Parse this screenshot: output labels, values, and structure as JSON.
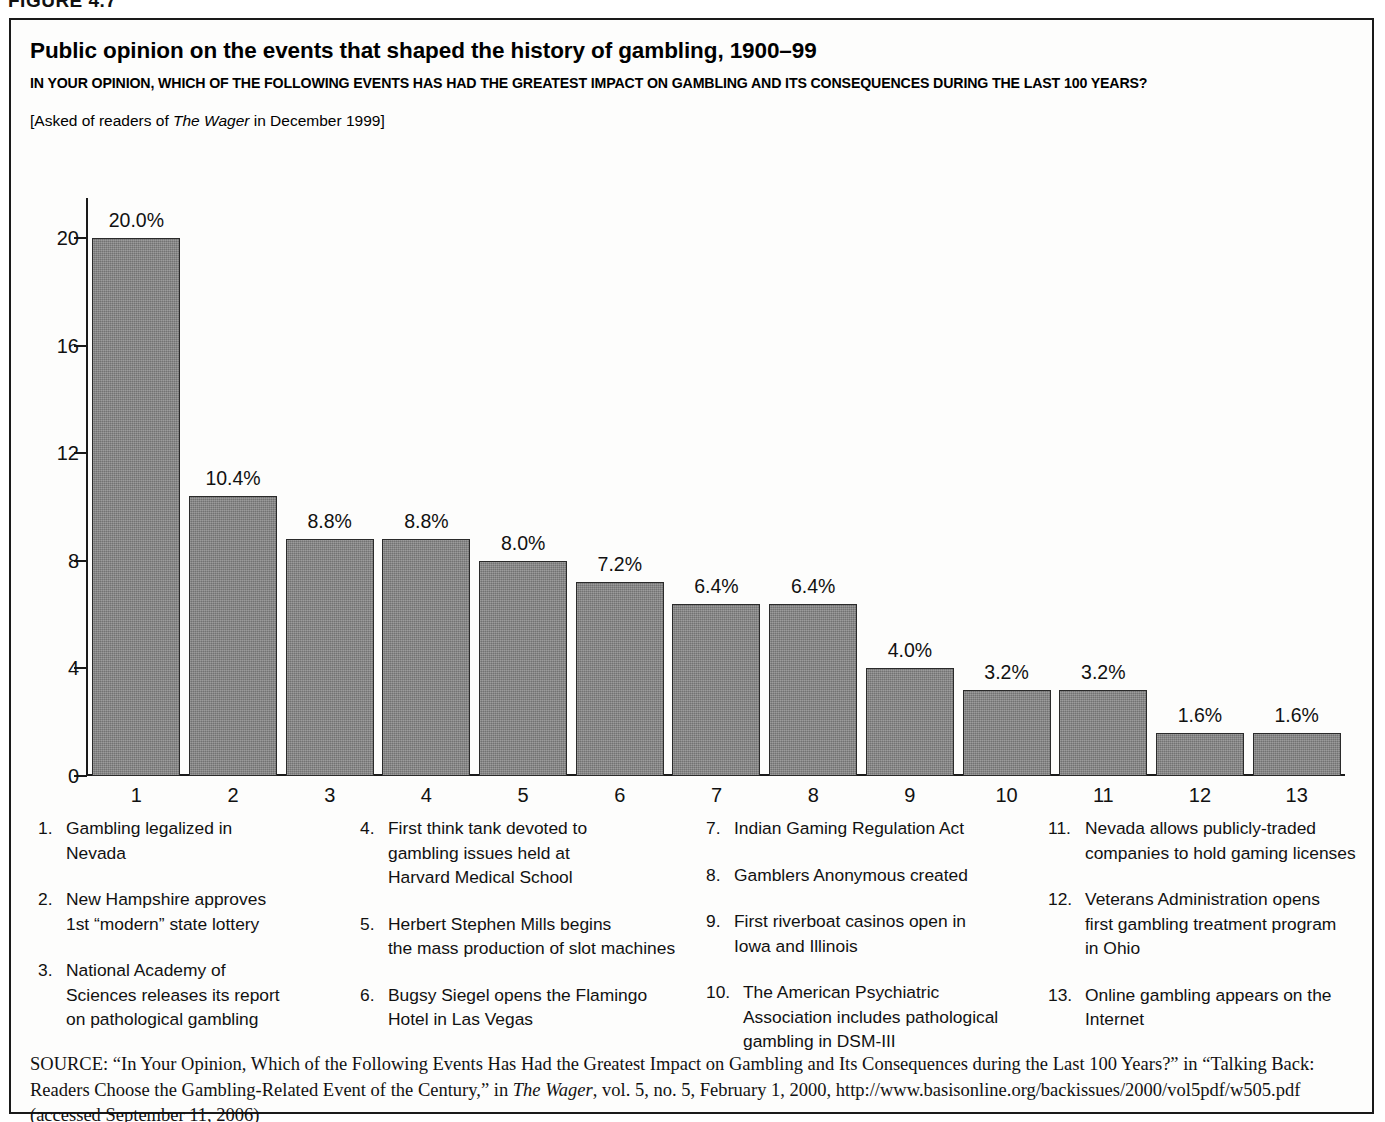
{
  "figure": {
    "label": "FIGURE 4.7"
  },
  "header": {
    "title": "Public opinion on the events that shaped the history of gambling, 1900–99",
    "subtitle": "IN YOUR OPINION, WHICH OF THE FOLLOWING EVENTS HAS HAD THE GREATEST IMPACT ON GAMBLING AND ITS CONSEQUENCES DURING THE LAST 100 YEARS?",
    "asked_prefix": "[Asked of readers of ",
    "asked_italic": "The Wager",
    "asked_suffix": " in December 1999]"
  },
  "chart_data": {
    "type": "bar",
    "title": "Public opinion on the events that shaped the history of gambling, 1900–99",
    "xlabel": "",
    "ylabel": "",
    "ylim": [
      0,
      21.5
    ],
    "yticks": [
      0,
      4,
      8,
      12,
      16,
      20
    ],
    "grid": false,
    "legend_position": "below-chart",
    "bar_color": "#808080",
    "bar_edge_color": "#2a2a2a",
    "categories": [
      "1",
      "2",
      "3",
      "4",
      "5",
      "6",
      "7",
      "8",
      "9",
      "10",
      "11",
      "12",
      "13"
    ],
    "values": [
      20.0,
      10.4,
      8.8,
      8.8,
      8.0,
      7.2,
      6.4,
      6.4,
      4.0,
      3.2,
      3.2,
      1.6,
      1.6
    ],
    "data_labels": [
      "20.0%",
      "10.4%",
      "8.8%",
      "8.8%",
      "8.0%",
      "7.2%",
      "6.4%",
      "6.4%",
      "4.0%",
      "3.2%",
      "3.2%",
      "1.6%",
      "1.6%"
    ],
    "annotations": [
      "1. Gambling legalized in Nevada",
      "2. New Hampshire approves 1st “modern” state lottery",
      "3. National Academy of Sciences releases its report on pathological gambling",
      "4. First think tank devoted to gambling issues held at Harvard Medical School",
      "5. Herbert Stephen Mills begins the mass production of slot machines",
      "6. Bugsy Siegel opens the Flamingo Hotel in Las Vegas",
      "7. Indian Gaming Regulation Act",
      "8. Gamblers Anonymous created",
      "9. First riverboat casinos open in Iowa and Illinois",
      "10. The American Psychiatric Association includes pathological gambling in DSM-III",
      "11. Nevada allows publicly-traded companies to hold gaming licenses",
      "12. Veterans Administration opens first gambling treatment program in Ohio",
      "13. Online gambling appears on the Internet"
    ]
  },
  "legend": {
    "columns": [
      {
        "items": [
          {
            "num": "1.",
            "lines": [
              "Gambling legalized in",
              "Nevada"
            ]
          },
          {
            "num": "2.",
            "lines": [
              "New Hampshire approves",
              "1st “modern” state lottery"
            ]
          },
          {
            "num": "3.",
            "lines": [
              "National Academy of",
              "Sciences releases its report",
              "on pathological gambling"
            ]
          }
        ]
      },
      {
        "items": [
          {
            "num": "4.",
            "lines": [
              "First think tank devoted to",
              "gambling issues held at",
              "Harvard Medical School"
            ]
          },
          {
            "num": "5.",
            "lines": [
              "Herbert Stephen Mills begins",
              "the mass production of slot machines"
            ]
          },
          {
            "num": "6.",
            "lines": [
              "Bugsy Siegel opens the Flamingo",
              "Hotel in Las Vegas"
            ]
          }
        ]
      },
      {
        "items": [
          {
            "num": "7.",
            "lines": [
              "Indian Gaming Regulation Act"
            ]
          },
          {
            "num": "8.",
            "lines": [
              "Gamblers Anonymous created"
            ]
          },
          {
            "num": "9.",
            "lines": [
              "First riverboat casinos open in",
              "Iowa and Illinois"
            ]
          },
          {
            "num": "10.",
            "lines": [
              "The American Psychiatric",
              "Association includes pathological",
              "gambling in DSM-III"
            ]
          }
        ]
      },
      {
        "items": [
          {
            "num": "11.",
            "lines": [
              "Nevada allows publicly-traded",
              "companies to hold gaming licenses"
            ]
          },
          {
            "num": "12.",
            "lines": [
              "Veterans Administration opens",
              "first gambling treatment program",
              "in Ohio"
            ]
          },
          {
            "num": "13.",
            "lines": [
              "Online gambling appears on the",
              "Internet"
            ]
          }
        ]
      }
    ]
  },
  "source": {
    "kicker": "SOURCE:",
    "part1": " “In Your Opinion, Which of the Following Events Has Had the Greatest Impact on Gambling and Its Consequences during the Last 100 Years?” in “Talking Back: Readers Choose the Gambling-Related Event of the Century,” in ",
    "italic1": "The Wager",
    "part2": ", vol. 5, no. 5, February 1, 2000, http://www.basisonline.org/backissues/2000/vol5pdf/w505.pdf (accessed September 11, 2006)"
  }
}
